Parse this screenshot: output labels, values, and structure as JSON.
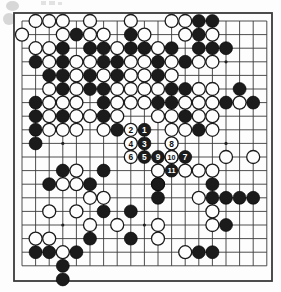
{
  "diagram": {
    "kind": "go-board-diagram",
    "board_size": 19,
    "title": "",
    "caption": "",
    "colors": {
      "black_stone": "#1b1b1b",
      "white_stone": "#fdfdfd",
      "grid_line": "#3a3a3a",
      "board_background": "#fdfdfd",
      "number_on_black": "#ffffff",
      "number_on_white": "#111111"
    },
    "geometry": {
      "origin_x": 22,
      "origin_y": 21,
      "step": 13.6,
      "stone_radius": 6.5,
      "board_left": 14,
      "board_top": 13,
      "board_right": 272,
      "board_bottom": 281
    },
    "star_points": [
      {
        "col": 4,
        "row": 4
      },
      {
        "col": 10,
        "row": 4
      },
      {
        "col": 16,
        "row": 4
      },
      {
        "col": 4,
        "row": 10
      },
      {
        "col": 10,
        "row": 10
      },
      {
        "col": 16,
        "row": 10
      },
      {
        "col": 4,
        "row": 16
      },
      {
        "col": 10,
        "row": 16
      },
      {
        "col": 16,
        "row": 16
      }
    ],
    "black_stones": [
      {
        "col": 14,
        "row": 1
      },
      {
        "col": 15,
        "row": 1
      },
      {
        "col": 5,
        "row": 2
      },
      {
        "col": 9,
        "row": 2
      },
      {
        "col": 14,
        "row": 2
      },
      {
        "col": 4,
        "row": 3
      },
      {
        "col": 6,
        "row": 3
      },
      {
        "col": 7,
        "row": 3
      },
      {
        "col": 9,
        "row": 3
      },
      {
        "col": 10,
        "row": 3
      },
      {
        "col": 12,
        "row": 3
      },
      {
        "col": 14,
        "row": 3
      },
      {
        "col": 15,
        "row": 3
      },
      {
        "col": 16,
        "row": 3
      },
      {
        "col": 2,
        "row": 4
      },
      {
        "col": 4,
        "row": 4
      },
      {
        "col": 7,
        "row": 4
      },
      {
        "col": 8,
        "row": 4
      },
      {
        "col": 11,
        "row": 4
      },
      {
        "col": 13,
        "row": 4
      },
      {
        "col": 3,
        "row": 5
      },
      {
        "col": 4,
        "row": 5
      },
      {
        "col": 6,
        "row": 5
      },
      {
        "col": 8,
        "row": 5
      },
      {
        "col": 11,
        "row": 5
      },
      {
        "col": 4,
        "row": 6
      },
      {
        "col": 6,
        "row": 6
      },
      {
        "col": 7,
        "row": 6
      },
      {
        "col": 12,
        "row": 6
      },
      {
        "col": 13,
        "row": 6
      },
      {
        "col": 17,
        "row": 6
      },
      {
        "col": 2,
        "row": 7
      },
      {
        "col": 7,
        "row": 7
      },
      {
        "col": 11,
        "row": 7
      },
      {
        "col": 12,
        "row": 7
      },
      {
        "col": 16,
        "row": 7
      },
      {
        "col": 18,
        "row": 7
      },
      {
        "col": 2,
        "row": 8
      },
      {
        "col": 4,
        "row": 8
      },
      {
        "col": 7,
        "row": 8
      },
      {
        "col": 13,
        "row": 8
      },
      {
        "col": 2,
        "row": 9
      },
      {
        "col": 8,
        "row": 9
      },
      {
        "col": 14,
        "row": 9
      },
      {
        "col": 2,
        "row": 10
      },
      {
        "col": 4,
        "row": 12
      },
      {
        "col": 7,
        "row": 12
      },
      {
        "col": 3,
        "row": 13
      },
      {
        "col": 11,
        "row": 13
      },
      {
        "col": 6,
        "row": 13
      },
      {
        "col": 15,
        "row": 13
      },
      {
        "col": 11,
        "row": 14
      },
      {
        "col": 15,
        "row": 14
      },
      {
        "col": 16,
        "row": 14
      },
      {
        "col": 17,
        "row": 14
      },
      {
        "col": 18,
        "row": 14
      },
      {
        "col": 7,
        "row": 15
      },
      {
        "col": 9,
        "row": 15
      },
      {
        "col": 16,
        "row": 16
      },
      {
        "col": 6,
        "row": 17
      },
      {
        "col": 9,
        "row": 17
      },
      {
        "col": 2,
        "row": 18
      },
      {
        "col": 3,
        "row": 18
      },
      {
        "col": 5,
        "row": 18
      },
      {
        "col": 14,
        "row": 18
      },
      {
        "col": 15,
        "row": 18
      },
      {
        "col": 4,
        "row": 19
      }
    ],
    "white_stones": [
      {
        "col": 2,
        "row": 1
      },
      {
        "col": 3,
        "row": 1
      },
      {
        "col": 4,
        "row": 1
      },
      {
        "col": 6,
        "row": 1
      },
      {
        "col": 9,
        "row": 1
      },
      {
        "col": 12,
        "row": 1
      },
      {
        "col": 13,
        "row": 1
      },
      {
        "col": 1,
        "row": 2
      },
      {
        "col": 4,
        "row": 2
      },
      {
        "col": 6,
        "row": 2
      },
      {
        "col": 7,
        "row": 2
      },
      {
        "col": 10,
        "row": 2
      },
      {
        "col": 13,
        "row": 2
      },
      {
        "col": 15,
        "row": 2
      },
      {
        "col": 2,
        "row": 3
      },
      {
        "col": 3,
        "row": 3
      },
      {
        "col": 8,
        "row": 3
      },
      {
        "col": 11,
        "row": 3
      },
      {
        "col": 3,
        "row": 4
      },
      {
        "col": 5,
        "row": 4
      },
      {
        "col": 6,
        "row": 4
      },
      {
        "col": 9,
        "row": 4
      },
      {
        "col": 10,
        "row": 4
      },
      {
        "col": 12,
        "row": 4
      },
      {
        "col": 14,
        "row": 4
      },
      {
        "col": 15,
        "row": 4
      },
      {
        "col": 5,
        "row": 5
      },
      {
        "col": 7,
        "row": 5
      },
      {
        "col": 9,
        "row": 5
      },
      {
        "col": 10,
        "row": 5
      },
      {
        "col": 12,
        "row": 5
      },
      {
        "col": 3,
        "row": 6
      },
      {
        "col": 5,
        "row": 6
      },
      {
        "col": 8,
        "row": 6
      },
      {
        "col": 9,
        "row": 6
      },
      {
        "col": 10,
        "row": 6
      },
      {
        "col": 11,
        "row": 6
      },
      {
        "col": 14,
        "row": 6
      },
      {
        "col": 15,
        "row": 6
      },
      {
        "col": 3,
        "row": 7
      },
      {
        "col": 4,
        "row": 7
      },
      {
        "col": 5,
        "row": 7
      },
      {
        "col": 8,
        "row": 7
      },
      {
        "col": 9,
        "row": 7
      },
      {
        "col": 10,
        "row": 7
      },
      {
        "col": 13,
        "row": 7
      },
      {
        "col": 14,
        "row": 7
      },
      {
        "col": 15,
        "row": 7
      },
      {
        "col": 17,
        "row": 7
      },
      {
        "col": 3,
        "row": 8
      },
      {
        "col": 5,
        "row": 8
      },
      {
        "col": 6,
        "row": 8
      },
      {
        "col": 8,
        "row": 8
      },
      {
        "col": 11,
        "row": 8
      },
      {
        "col": 12,
        "row": 8
      },
      {
        "col": 14,
        "row": 8
      },
      {
        "col": 15,
        "row": 8
      },
      {
        "col": 3,
        "row": 9
      },
      {
        "col": 4,
        "row": 9
      },
      {
        "col": 5,
        "row": 9
      },
      {
        "col": 7,
        "row": 9
      },
      {
        "col": 12,
        "row": 9
      },
      {
        "col": 13,
        "row": 9
      },
      {
        "col": 15,
        "row": 9
      },
      {
        "col": 12,
        "row": 11
      },
      {
        "col": 16,
        "row": 11
      },
      {
        "col": 18,
        "row": 11
      },
      {
        "col": 5,
        "row": 12
      },
      {
        "col": 11,
        "row": 12
      },
      {
        "col": 13,
        "row": 12
      },
      {
        "col": 14,
        "row": 12
      },
      {
        "col": 15,
        "row": 12
      },
      {
        "col": 4,
        "row": 13
      },
      {
        "col": 5,
        "row": 13
      },
      {
        "col": 11,
        "row": 13
      },
      {
        "col": 6,
        "row": 14
      },
      {
        "col": 7,
        "row": 14
      },
      {
        "col": 14,
        "row": 14
      },
      {
        "col": 3,
        "row": 15
      },
      {
        "col": 5,
        "row": 15
      },
      {
        "col": 15,
        "row": 15
      },
      {
        "col": 6,
        "row": 16
      },
      {
        "col": 8,
        "row": 16
      },
      {
        "col": 11,
        "row": 16
      },
      {
        "col": 15,
        "row": 16
      },
      {
        "col": 2,
        "row": 17
      },
      {
        "col": 3,
        "row": 17
      },
      {
        "col": 11,
        "row": 17
      },
      {
        "col": 4,
        "row": 18
      },
      {
        "col": 13,
        "row": 18
      }
    ],
    "moves": [
      {
        "n": 1,
        "col": 10,
        "row": 9,
        "color": "black"
      },
      {
        "n": 2,
        "col": 9,
        "row": 9,
        "color": "white"
      },
      {
        "n": 3,
        "col": 10,
        "row": 10,
        "color": "black"
      },
      {
        "n": 4,
        "col": 9,
        "row": 10,
        "color": "white"
      },
      {
        "n": 5,
        "col": 10,
        "row": 11,
        "color": "black"
      },
      {
        "n": 6,
        "col": 9,
        "row": 11,
        "color": "white"
      },
      {
        "n": 7,
        "col": 13,
        "row": 11,
        "color": "black"
      },
      {
        "n": 8,
        "col": 12,
        "row": 10,
        "color": "white"
      },
      {
        "n": 9,
        "col": 11,
        "row": 11,
        "color": "black"
      },
      {
        "n": 10,
        "col": 12,
        "row": 11,
        "color": "white"
      },
      {
        "n": 11,
        "col": 12,
        "row": 12,
        "color": "black"
      }
    ],
    "partial_stones": [
      {
        "col": 4,
        "row": 20,
        "color": "black",
        "note": "stone below bottom edge"
      }
    ],
    "artifacts": [
      {
        "name": "scan-smudge-top",
        "x": 6,
        "y": 2,
        "w": 13,
        "h": 9
      },
      {
        "name": "scan-smudge-left",
        "x": 4,
        "y": 14,
        "w": 11,
        "h": 11
      },
      {
        "name": "scan-mark-a",
        "x": 40,
        "y": 1,
        "w": 5,
        "h": 4
      },
      {
        "name": "scan-mark-b",
        "x": 48,
        "y": 1,
        "w": 6,
        "h": 4
      },
      {
        "name": "scan-mark-c",
        "x": 57,
        "y": 1,
        "w": 4,
        "h": 4
      }
    ]
  }
}
